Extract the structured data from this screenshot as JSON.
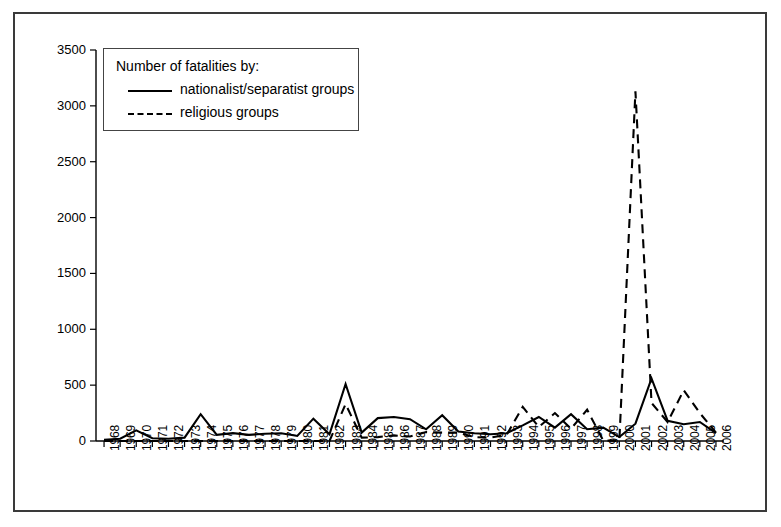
{
  "chart_data": {
    "type": "line",
    "title": "",
    "subtitle": "",
    "xlabel": "",
    "ylabel": "",
    "ylim": [
      0,
      3500
    ],
    "ytick_step": 500,
    "yticks": [
      0,
      500,
      1000,
      1500,
      2000,
      2500,
      3000,
      3500
    ],
    "grid": false,
    "legend_position": "upper-left-inset",
    "legend_title": "Number of fatalities by:",
    "categories": [
      "1968",
      "1969",
      "1970",
      "1971",
      "1972",
      "1973",
      "1974",
      "1975",
      "1976",
      "1977",
      "1978",
      "1979",
      "1980",
      "1981",
      "1982",
      "1983",
      "1984",
      "1985",
      "1986",
      "1987",
      "1988",
      "1989",
      "1990",
      "1991",
      "1992",
      "1993",
      "1994",
      "1995",
      "1996",
      "1997",
      "1998",
      "1999",
      "2000",
      "2001",
      "2002",
      "2003",
      "2004",
      "2005",
      "2006"
    ],
    "series": [
      {
        "name": "nationalist/separatist groups",
        "style": "solid",
        "color": "#000000",
        "values": [
          10,
          20,
          95,
          25,
          20,
          30,
          240,
          55,
          70,
          55,
          65,
          70,
          45,
          200,
          60,
          510,
          75,
          205,
          215,
          195,
          105,
          230,
          85,
          70,
          60,
          70,
          140,
          215,
          120,
          240,
          105,
          120,
          35,
          155,
          560,
          180,
          150,
          170,
          70
        ]
      },
      {
        "name": "religious groups",
        "style": "dashed",
        "color": "#000000",
        "values": [
          0,
          0,
          0,
          0,
          0,
          0,
          0,
          0,
          0,
          0,
          0,
          0,
          0,
          0,
          0,
          330,
          30,
          35,
          50,
          40,
          80,
          75,
          75,
          35,
          30,
          55,
          305,
          125,
          250,
          110,
          280,
          5,
          0,
          3130,
          340,
          170,
          455,
          250,
          75
        ]
      }
    ]
  },
  "legend": {
    "title": "Number of fatalities by:",
    "entries": [
      {
        "label": "nationalist/separatist groups",
        "style": "solid"
      },
      {
        "label": "religious groups",
        "style": "dashed"
      }
    ]
  },
  "axes": {
    "y_tick_labels": [
      "3500",
      "3000",
      "2500",
      "2000",
      "1500",
      "1000",
      "500",
      "0"
    ],
    "x_tick_labels": [
      "1968",
      "1969",
      "1970",
      "1971",
      "1972",
      "1973",
      "1974",
      "1975",
      "1976",
      "1977",
      "1978",
      "1979",
      "1980",
      "1981",
      "1982",
      "1983",
      "1984",
      "1985",
      "1986",
      "1987",
      "1988",
      "1989",
      "1990",
      "1991",
      "1992",
      "1993",
      "1994",
      "1995",
      "1996",
      "1997",
      "1998",
      "1999",
      "2000",
      "2001",
      "2002",
      "2003",
      "2004",
      "2005",
      "2006"
    ]
  },
  "colors": {
    "frame": "#3a3a3a",
    "axis": "#000000",
    "series": "#000000",
    "background": "#ffffff"
  }
}
